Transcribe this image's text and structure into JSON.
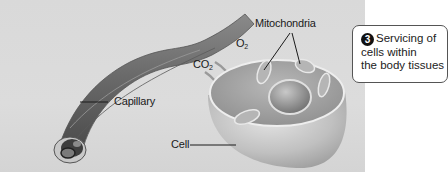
{
  "labels": {
    "mitochondria": "Mitochondria",
    "o2_main": "O",
    "o2_sub": "2",
    "co2_main": "CO",
    "co2_sub": "2",
    "capillary": "Capillary",
    "cell": "Cell"
  },
  "callout": {
    "step_number": "3",
    "line1": "Servicing of",
    "line2": "cells within",
    "line3": "the body tissues"
  },
  "colors": {
    "background_panel": "#d9d9d9",
    "callout_border": "#555555",
    "badge": "#111111"
  }
}
